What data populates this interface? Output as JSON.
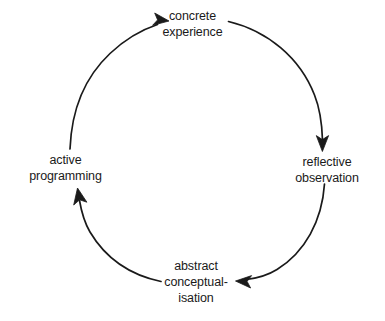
{
  "diagram": {
    "type": "cycle",
    "background_color": "#ffffff",
    "stroke_color": "#1a1a1a",
    "text_color": "#1a1a1a",
    "direction": "clockwise",
    "nodes": [
      {
        "id": "concrete-experience",
        "lines": [
          "concrete",
          "experience"
        ],
        "position": "top"
      },
      {
        "id": "reflective-observation",
        "lines": [
          "reflective",
          "observation"
        ],
        "position": "right"
      },
      {
        "id": "abstract-conceptualisation",
        "lines": [
          "abstract",
          "conceptual-",
          "isation"
        ],
        "position": "bottom"
      },
      {
        "id": "active-programming",
        "lines": [
          "active",
          "programming"
        ],
        "position": "left"
      }
    ],
    "arrows": [
      {
        "id": "arrow-concrete-to-reflective",
        "from": "concrete-experience",
        "to": "reflective-observation"
      },
      {
        "id": "arrow-reflective-to-abstract",
        "from": "reflective-observation",
        "to": "abstract-conceptualisation"
      },
      {
        "id": "arrow-abstract-to-active",
        "from": "abstract-conceptualisation",
        "to": "active-programming"
      },
      {
        "id": "arrow-active-to-concrete",
        "from": "active-programming",
        "to": "concrete-experience"
      }
    ]
  }
}
